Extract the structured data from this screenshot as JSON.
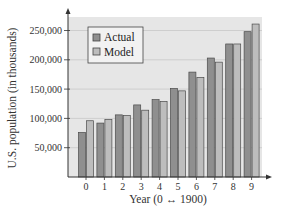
{
  "chart_data": {
    "type": "bar",
    "title": "",
    "xlabel": "Year (0 ↔ 1900)",
    "ylabel": "U.S. population (in thousands)",
    "categories": [
      "0",
      "1",
      "2",
      "3",
      "4",
      "5",
      "6",
      "7",
      "8",
      "9"
    ],
    "series": [
      {
        "name": "Actual",
        "color": "#8f8f8f",
        "values": [
          76000,
          92000,
          106000,
          123000,
          132000,
          151000,
          179000,
          203000,
          227000,
          248000
        ]
      },
      {
        "name": "Model",
        "color": "#bdbdbd",
        "values": [
          96000,
          98000,
          105000,
          114000,
          129000,
          147000,
          170000,
          196000,
          227000,
          261000
        ]
      }
    ],
    "yticks": [
      50000,
      100000,
      150000,
      200000,
      250000
    ],
    "ytick_labels": [
      "50,000",
      "100,000",
      "150,000",
      "200,000",
      "250,000"
    ],
    "ylim": [
      0,
      270000
    ],
    "grid": true,
    "legend_position": "upper-left"
  },
  "colors": {
    "plot_background": "#e6e6e6",
    "gridline": "#c8c8c8",
    "axis": "#333333",
    "bar_outline": "#4a4a4a"
  }
}
